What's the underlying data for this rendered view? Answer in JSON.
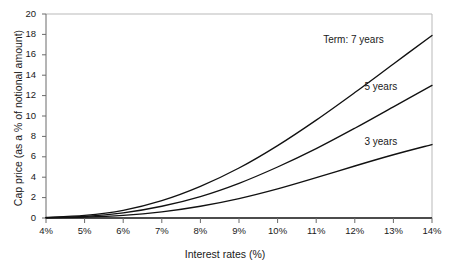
{
  "chart_data": {
    "type": "line",
    "title": "",
    "xlabel": "Interest rates (%)",
    "ylabel": "Cap price (as a % of notional amount)",
    "xlim": [
      4,
      14
    ],
    "ylim": [
      0,
      20
    ],
    "grid": false,
    "legend_position": "inline-right",
    "xticks": [
      4,
      5,
      6,
      7,
      8,
      9,
      10,
      11,
      12,
      13,
      14
    ],
    "xtick_labels": [
      "4%",
      "5%",
      "6%",
      "7%",
      "8%",
      "9%",
      "10%",
      "11%",
      "12%",
      "13%",
      "14%"
    ],
    "yticks": [
      0,
      2,
      4,
      6,
      8,
      10,
      12,
      14,
      16,
      18,
      20
    ],
    "ytick_labels": [
      "0",
      "2",
      "4",
      "6",
      "8",
      "10",
      "12",
      "14",
      "16",
      "18",
      "20"
    ],
    "x": [
      4,
      5,
      6,
      7,
      8,
      9,
      10,
      11,
      12,
      13,
      14
    ],
    "series": [
      {
        "name": "Term: 7 years",
        "label": "Term: 7 years",
        "color": "#111111",
        "values": [
          0.05,
          0.25,
          0.75,
          1.7,
          3.1,
          4.9,
          7.1,
          9.6,
          12.3,
          15.1,
          17.9
        ]
      },
      {
        "name": "5 years",
        "label": "5 years",
        "color": "#111111",
        "values": [
          0.03,
          0.15,
          0.5,
          1.15,
          2.1,
          3.4,
          5.0,
          6.8,
          8.8,
          10.9,
          13.0
        ]
      },
      {
        "name": "3 years",
        "label": "3 years",
        "color": "#111111",
        "values": [
          0.02,
          0.08,
          0.25,
          0.6,
          1.15,
          1.9,
          2.85,
          3.95,
          5.1,
          6.2,
          7.2
        ]
      }
    ],
    "annotations": [
      {
        "text": "Term: 7 years",
        "x": 12.75,
        "y": 17.45
      },
      {
        "text": "5 years",
        "x": 13.1,
        "y": 12.8
      },
      {
        "text": "3 years",
        "x": 13.1,
        "y": 7.5
      }
    ],
    "colors": {
      "line": "#111111",
      "frame": "#b9b9b9",
      "axis": "#5a5a5a",
      "background": "#ffffff",
      "text": "#1a1a1a"
    }
  }
}
